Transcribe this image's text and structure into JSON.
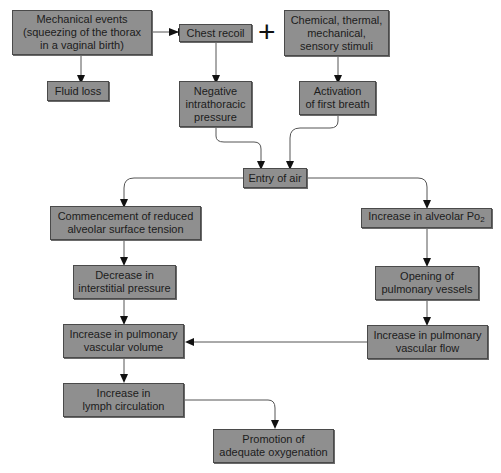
{
  "diagram": {
    "type": "flowchart",
    "plus_symbol": "+",
    "nodes": {
      "mechanical_events": "Mechanical events\n(squeezing of the thorax\nin a vaginal birth)",
      "chest_recoil": "Chest recoil",
      "stimuli": "Chemical, thermal,\nmechanical,\nsensory stimuli",
      "fluid_loss": "Fluid loss",
      "negative_pressure": "Negative\nintrathoracic\npressure",
      "first_breath": "Activation\nof first breath",
      "entry_of_air": "Entry of air",
      "surface_tension": "Commencement of reduced\nalveolar surface tension",
      "alveolar_po2": "Increase in alveolar Po",
      "alveolar_po2_sub": "2",
      "interstitial_pressure": "Decrease in\ninterstitial pressure",
      "opening_vessels": "Opening of\npulmonary vessels",
      "vascular_volume": "Increase in pulmonary\nvascular volume",
      "vascular_flow": "Increase in pulmonary\nvascular flow",
      "lymph_circulation": "Increase in\nlymph circulation",
      "oxygenation": "Promotion of\nadequate oxygenation"
    },
    "edges": [
      [
        "mechanical_events",
        "chest_recoil"
      ],
      [
        "mechanical_events",
        "fluid_loss"
      ],
      [
        "chest_recoil",
        "negative_pressure"
      ],
      [
        "stimuli",
        "first_breath"
      ],
      [
        "negative_pressure",
        "entry_of_air"
      ],
      [
        "first_breath",
        "entry_of_air"
      ],
      [
        "entry_of_air",
        "surface_tension"
      ],
      [
        "entry_of_air",
        "alveolar_po2"
      ],
      [
        "surface_tension",
        "interstitial_pressure"
      ],
      [
        "interstitial_pressure",
        "vascular_volume"
      ],
      [
        "alveolar_po2",
        "opening_vessels"
      ],
      [
        "opening_vessels",
        "vascular_flow"
      ],
      [
        "vascular_flow",
        "vascular_volume"
      ],
      [
        "vascular_volume",
        "lymph_circulation"
      ],
      [
        "lymph_circulation",
        "oxygenation"
      ]
    ],
    "colors": {
      "box_fill": "#8f8f8f",
      "box_border": "#4a4a4a",
      "line": "#555555"
    }
  }
}
